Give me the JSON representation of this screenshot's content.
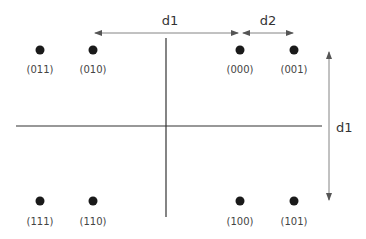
{
  "diagram": {
    "type": "constellation",
    "colors": {
      "point": "#1a1a1a",
      "axis": "#333333",
      "arrow": "#555555",
      "text": "#444444"
    },
    "points": [
      {
        "id": "p011",
        "label": "(011)",
        "x": 40,
        "y": 50
      },
      {
        "id": "p010",
        "label": "(010)",
        "x": 93,
        "y": 50
      },
      {
        "id": "p000",
        "label": "(000)",
        "x": 240,
        "y": 50
      },
      {
        "id": "p001",
        "label": "(001)",
        "x": 294,
        "y": 50
      },
      {
        "id": "p111",
        "label": "(111)",
        "x": 40,
        "y": 201
      },
      {
        "id": "p110",
        "label": "(110)",
        "x": 93,
        "y": 201
      },
      {
        "id": "p100",
        "label": "(100)",
        "x": 240,
        "y": 201
      },
      {
        "id": "p101",
        "label": "(101)",
        "x": 294,
        "y": 201
      }
    ],
    "distances": {
      "d1_horizontal": {
        "label": "d1"
      },
      "d2_horizontal": {
        "label": "d2"
      },
      "d1_vertical": {
        "label": "d1"
      }
    }
  }
}
